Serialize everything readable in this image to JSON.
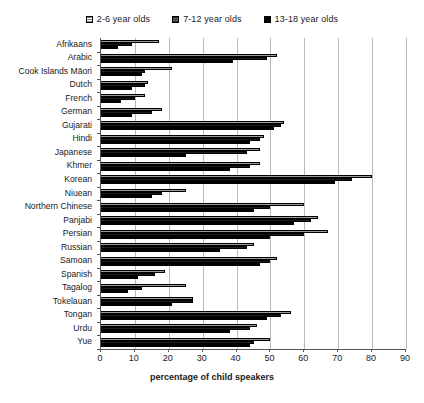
{
  "chart_data": {
    "type": "bar",
    "orientation": "horizontal",
    "title": "",
    "xlabel": "percentage of child speakers",
    "ylabel": "",
    "xlim": [
      0,
      90
    ],
    "xticks": [
      0,
      10,
      20,
      30,
      40,
      50,
      60,
      70,
      80,
      90
    ],
    "grid": true,
    "legend_position": "top-center",
    "categories": [
      "Afrikaans",
      "Arabic",
      "Cook Islands Māori",
      "Dutch",
      "French",
      "German",
      "Gujarati",
      "Hindi",
      "Japanese",
      "Khmer",
      "Korean",
      "Niuean",
      "Northern Chinese",
      "Panjabi",
      "Persian",
      "Russian",
      "Samoan",
      "Spanish",
      "Tagalog",
      "Tokelauan",
      "Tongan",
      "Urdu",
      "Yue"
    ],
    "series": [
      {
        "name": "2-6 year olds",
        "fill": "light-hatch",
        "values": [
          17,
          52,
          21,
          14,
          13,
          18,
          54,
          48,
          47,
          47,
          80,
          25,
          60,
          64,
          67,
          45,
          52,
          19,
          25,
          27,
          56,
          46,
          50
        ]
      },
      {
        "name": "7-12 year olds",
        "fill": "dark-hatch",
        "values": [
          9,
          49,
          13,
          13,
          10,
          15,
          53,
          47,
          43,
          44,
          74,
          18,
          50,
          62,
          60,
          43,
          50,
          16,
          12,
          27,
          53,
          44,
          45
        ]
      },
      {
        "name": "13-18 year olds",
        "fill": "solid-black",
        "values": [
          5,
          39,
          12,
          9,
          6,
          9,
          51,
          44,
          25,
          38,
          69,
          15,
          45,
          57,
          50,
          35,
          47,
          11,
          8,
          21,
          49,
          38,
          44
        ]
      }
    ]
  },
  "legend": {
    "items": [
      {
        "label": "2-6 year olds"
      },
      {
        "label": "7-12 year olds"
      },
      {
        "label": "13-18 year olds"
      }
    ]
  },
  "colors": {
    "series_light": "#ffffff",
    "series_medium": "#4a4a4a",
    "series_dark": "#000000",
    "gridline": "#b9b9b9",
    "axis": "#555555",
    "text": "#1a1a1a"
  }
}
